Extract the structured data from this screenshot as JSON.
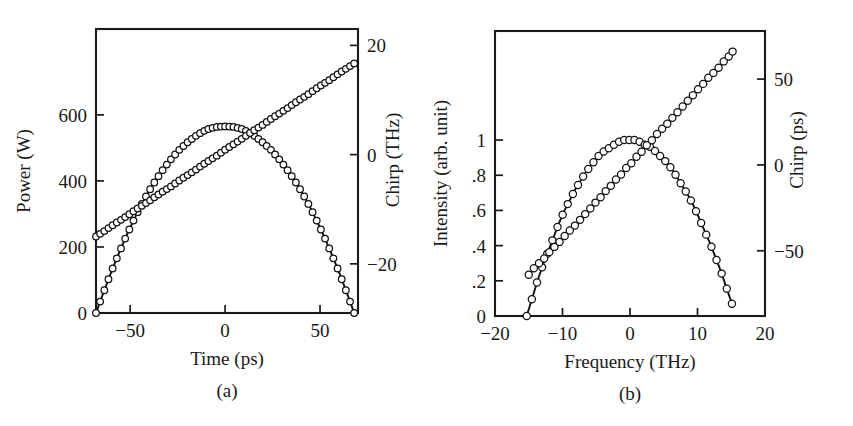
{
  "figure": {
    "background": "#ffffff",
    "ink": "#1a1a1a",
    "marker_face": "#ffffff",
    "marker_edge": "#111111"
  },
  "chart_data": [
    {
      "type": "line",
      "panel": "a",
      "caption": "(a)",
      "title": "",
      "xlabel": "Time (ps)",
      "ylabel": "Power (W)",
      "y2label": "Chirp (THz)",
      "xlim": [
        -68,
        70
      ],
      "ylim": [
        0,
        860
      ],
      "y2lim": [
        -29,
        23
      ],
      "xticks": [
        -50,
        0,
        50
      ],
      "xticklabels": [
        "−50",
        "0",
        "50"
      ],
      "yticks": [
        0,
        200,
        400,
        600
      ],
      "yticklabels": [
        "0",
        "200",
        "400",
        "600"
      ],
      "y2ticks": [
        -20,
        0,
        20
      ],
      "y2ticklabels": [
        "−20",
        "0",
        "20"
      ],
      "grid": false,
      "legend": "none",
      "series": [
        {
          "name": "Power",
          "axis": "left",
          "style": "line+open-circles",
          "comment": "parabolic pulse, peak 565 W at t = 0, zero at t = ±68 ps",
          "x": [
            -68,
            -64,
            -60,
            -56,
            -52,
            -48,
            -44,
            -40,
            -36,
            -32,
            -28,
            -24,
            -20,
            -16,
            -12,
            -8,
            -4,
            0,
            4,
            8,
            12,
            16,
            20,
            24,
            28,
            32,
            36,
            40,
            44,
            48,
            52,
            56,
            60,
            64,
            68
          ],
          "y": [
            0,
            63,
            124,
            180,
            234,
            283,
            329,
            370,
            407,
            440,
            469,
            495,
            516,
            534,
            549,
            559,
            564,
            565,
            564,
            559,
            549,
            534,
            516,
            495,
            469,
            440,
            407,
            370,
            329,
            283,
            234,
            180,
            124,
            63,
            0
          ]
        },
        {
          "name": "Chirp",
          "axis": "right",
          "style": "line+open-circles",
          "comment": "linear chirp, slope ≈ 0.235 THz/ps",
          "x": [
            -68,
            -64,
            -60,
            -56,
            -52,
            -48,
            -44,
            -40,
            -36,
            -32,
            -28,
            -24,
            -20,
            -16,
            -12,
            -8,
            -4,
            0,
            4,
            8,
            12,
            16,
            20,
            24,
            28,
            32,
            36,
            40,
            44,
            48,
            52,
            56,
            60,
            64,
            68
          ],
          "y": [
            -15.0,
            -14.1,
            -13.1,
            -12.2,
            -11.3,
            -10.3,
            -9.4,
            -8.5,
            -7.5,
            -6.6,
            -5.7,
            -4.7,
            -3.8,
            -2.9,
            -1.9,
            -1.0,
            -0.1,
            0.9,
            1.8,
            2.7,
            3.7,
            4.6,
            5.5,
            6.5,
            7.4,
            8.3,
            9.3,
            10.2,
            11.1,
            12.1,
            13.0,
            13.9,
            14.9,
            15.8,
            16.7
          ]
        }
      ]
    },
    {
      "type": "line",
      "panel": "b",
      "caption": "(b)",
      "title": "",
      "xlabel": "Frequency (THz)",
      "ylabel": "Intensity (arb. unit)",
      "y2label": "Chirp (ps)",
      "xlim": [
        -20,
        20
      ],
      "ylim": [
        0,
        1.62
      ],
      "y2lim": [
        -88,
        78
      ],
      "xticks": [
        -20,
        -10,
        0,
        10,
        20
      ],
      "xticklabels": [
        "−20",
        "−10",
        "0",
        "10",
        "20"
      ],
      "yticks": [
        0,
        0.2,
        0.4,
        0.6,
        0.8,
        1.0
      ],
      "yticklabels": [
        "0",
        ".2",
        ".4",
        ".6",
        ".8",
        "1"
      ],
      "y2ticks": [
        -50,
        0,
        50
      ],
      "y2ticklabels": [
        "−50",
        "0",
        "50"
      ],
      "grid": false,
      "legend": "none",
      "series": [
        {
          "name": "Intensity",
          "axis": "left",
          "style": "line+open-circles",
          "comment": "near-parabolic spectrum, peak 1.0 at 0 THz, zero at ±15.3 THz",
          "x": [
            -15.3,
            -14.5,
            -13.7,
            -12.9,
            -12.1,
            -11.3,
            -10.5,
            -9.7,
            -8.9,
            -8.1,
            -7.3,
            -6.5,
            -5.7,
            -4.9,
            -4.1,
            -3.3,
            -2.5,
            -1.7,
            -0.9,
            -0.1,
            0.7,
            1.5,
            2.3,
            3.1,
            3.9,
            4.7,
            5.5,
            6.3,
            7.1,
            7.9,
            8.7,
            9.5,
            10.3,
            11.1,
            11.9,
            12.7,
            13.5,
            14.3,
            15.1
          ],
          "y": [
            0.0,
            0.1,
            0.2,
            0.29,
            0.37,
            0.45,
            0.53,
            0.6,
            0.66,
            0.72,
            0.77,
            0.82,
            0.86,
            0.9,
            0.93,
            0.95,
            0.97,
            0.99,
            1.0,
            1.0,
            1.0,
            0.99,
            0.97,
            0.96,
            0.93,
            0.9,
            0.87,
            0.83,
            0.78,
            0.73,
            0.68,
            0.62,
            0.55,
            0.48,
            0.41,
            0.33,
            0.25,
            0.16,
            0.07
          ]
        },
        {
          "name": "Chirp",
          "axis": "right",
          "style": "line+open-circles",
          "comment": "linear chirp in the spectral domain, slope ≈ 4.3 ps/THz",
          "x": [
            -15.0,
            -14.2,
            -13.4,
            -12.6,
            -11.8,
            -11.0,
            -10.2,
            -9.4,
            -8.6,
            -7.8,
            -7.0,
            -6.2,
            -5.4,
            -4.6,
            -3.8,
            -3.0,
            -2.2,
            -1.4,
            -0.6,
            0.2,
            1.0,
            1.8,
            2.6,
            3.4,
            4.2,
            5.0,
            5.8,
            6.6,
            7.4,
            8.2,
            9.0,
            9.8,
            10.6,
            11.4,
            12.2,
            13.0,
            13.8,
            14.6,
            15.2
          ],
          "y": [
            -64,
            -60,
            -57,
            -54,
            -50,
            -47,
            -44,
            -40,
            -37,
            -34,
            -30,
            -27,
            -23,
            -20,
            -16,
            -13,
            -9,
            -6,
            -2,
            1,
            5,
            8,
            12,
            15,
            19,
            22,
            25,
            29,
            32,
            36,
            39,
            43,
            46,
            50,
            53,
            56,
            60,
            63,
            66
          ]
        }
      ]
    }
  ]
}
